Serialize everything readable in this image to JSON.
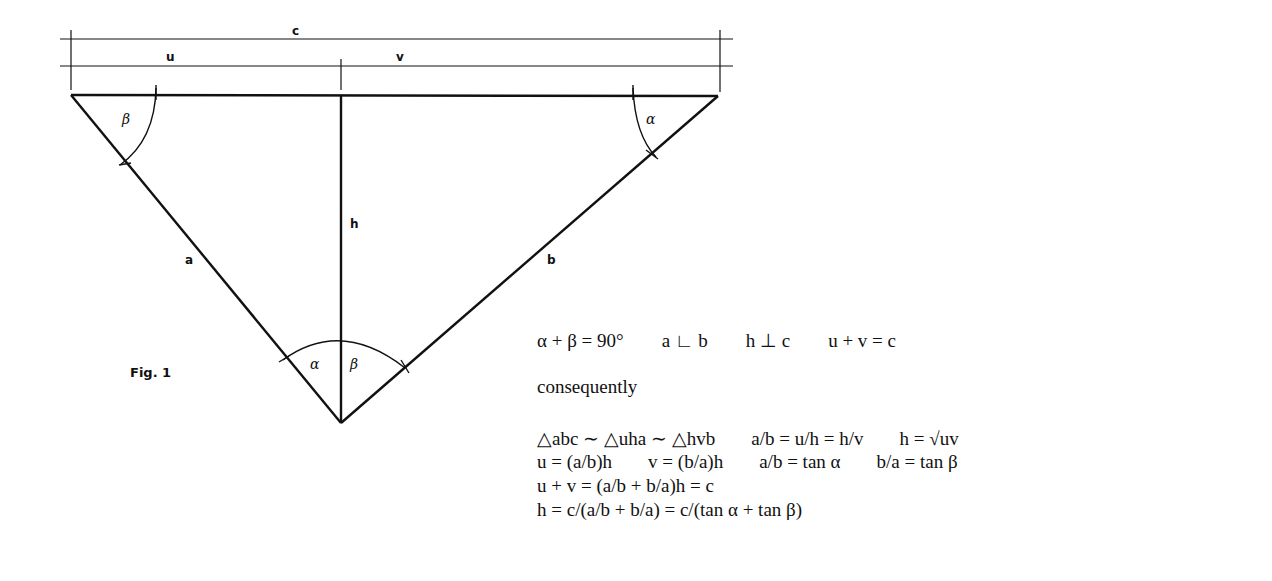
{
  "figure": {
    "caption": "Fig. 1",
    "dimension_labels": {
      "c": "c",
      "u": "u",
      "v": "v"
    },
    "side_labels": {
      "a": "a",
      "b": "b",
      "h": "h"
    },
    "angle_labels": {
      "top_left": "β",
      "top_right": "α",
      "bottom_left": "α",
      "bottom_right": "β"
    }
  },
  "equations": {
    "line1": [
      "α + β = 90°",
      "a ∟ b",
      "h ⊥ c",
      "u + v = c"
    ],
    "consequently": "consequently",
    "line2": [
      "△abc ∼ △uha ∼ △hvb",
      "a/b = u/h = h/v",
      "h = √uv"
    ],
    "line3": [
      "u = (a/b)h",
      "v = (b/a)h",
      "a/b = tan α",
      "b/a = tan β"
    ],
    "line4": [
      "u + v = (a/b + b/a)h = c"
    ],
    "line5": [
      "h = c/(a/b + b/a) = c/(tan α + tan β)"
    ]
  }
}
